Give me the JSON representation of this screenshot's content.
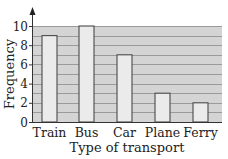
{
  "chart_data": {
    "type": "bar",
    "title": "",
    "xlabel": "Type of transport",
    "ylabel": "Frequency",
    "categories": [
      "Train",
      "Bus",
      "Car",
      "Plane",
      "Ferry"
    ],
    "values": [
      9,
      10,
      7,
      3,
      2
    ],
    "ylim": [
      0,
      10
    ],
    "yticks": [
      0,
      2,
      4,
      6,
      8,
      10
    ],
    "minor_gridline_step": 1,
    "grid": true,
    "legend": null
  },
  "colors": {
    "plot_background": "#d4d4d4",
    "bar_fill": "#ebebeb",
    "bar_stroke": "#4a4a4a",
    "gridline": "#8c8c8c",
    "axis": "#333333"
  }
}
